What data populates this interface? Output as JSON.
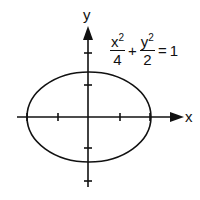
{
  "diagram": {
    "type": "ellipse-graph",
    "axis_labels": {
      "x": "x",
      "y": "y"
    },
    "equation": {
      "term1": {
        "numerator_var": "x",
        "numerator_exp": "2",
        "denominator": "4"
      },
      "plus": "+",
      "term2": {
        "numerator_var": "y",
        "numerator_exp": "2",
        "denominator": "2"
      },
      "equals": "=",
      "rhs": "1"
    },
    "ellipse": {
      "semi_major_x": 2,
      "semi_minor_y": 1.414
    },
    "colors": {
      "stroke": "#111111",
      "background": "#ffffff"
    }
  }
}
